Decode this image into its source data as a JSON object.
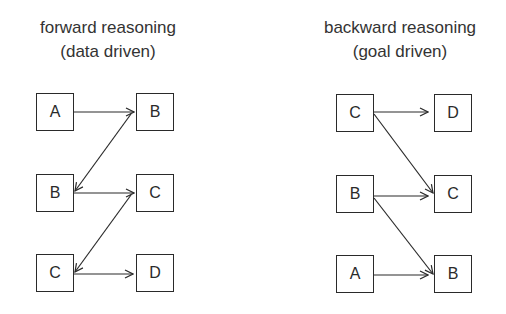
{
  "diagrams": [
    {
      "title_line1": "forward reasoning",
      "title_line2": "(data driven)",
      "nodes": [
        {
          "id": "f-a",
          "label": "A"
        },
        {
          "id": "f-b1",
          "label": "B"
        },
        {
          "id": "f-b2",
          "label": "B"
        },
        {
          "id": "f-c1",
          "label": "C"
        },
        {
          "id": "f-c2",
          "label": "C"
        },
        {
          "id": "f-d",
          "label": "D"
        }
      ],
      "edges": [
        {
          "from": "A",
          "to": "B",
          "desc": "A to B (top row)"
        },
        {
          "from": "B",
          "to": "B",
          "desc": "top-right B to middle-left B"
        },
        {
          "from": "B",
          "to": "C",
          "desc": "B to C (middle row)"
        },
        {
          "from": "C",
          "to": "C",
          "desc": "middle-right C to bottom-left C"
        },
        {
          "from": "C",
          "to": "D",
          "desc": "C to D (bottom row)"
        }
      ]
    },
    {
      "title_line1": "backward reasoning",
      "title_line2": "(goal driven)",
      "nodes": [
        {
          "id": "b-c1",
          "label": "C"
        },
        {
          "id": "b-d",
          "label": "D"
        },
        {
          "id": "b-b1",
          "label": "B"
        },
        {
          "id": "b-c2",
          "label": "C"
        },
        {
          "id": "b-a",
          "label": "A"
        },
        {
          "id": "b-b2",
          "label": "B"
        }
      ],
      "edges": [
        {
          "from": "C",
          "to": "D",
          "desc": "C to D (top row)"
        },
        {
          "from": "C",
          "to": "C",
          "desc": "top-left C to middle-right C"
        },
        {
          "from": "B",
          "to": "C",
          "desc": "B to C (middle row)"
        },
        {
          "from": "B",
          "to": "B",
          "desc": "middle-left B to bottom-right B"
        },
        {
          "from": "A",
          "to": "B",
          "desc": "A to B (bottom row)"
        }
      ]
    }
  ]
}
